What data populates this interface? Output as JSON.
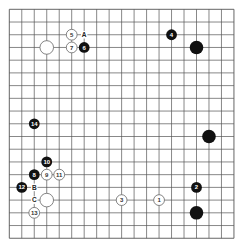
{
  "board": {
    "size": 19,
    "origin": {
      "x": 9.3,
      "y": 9.3
    },
    "spacing": {
      "x": 12.48,
      "y": 12.72
    },
    "colors": {
      "background": "#ffffff",
      "grid_line": "#555555",
      "black_stone": "#111111",
      "white_stone": "#ffffff",
      "white_stone_border": "#666666",
      "black_label": "#ffffff",
      "white_label": "#333333"
    }
  },
  "stones": [
    {
      "color": "white",
      "col": 3,
      "row": 3,
      "label": ""
    },
    {
      "color": "white",
      "col": 5,
      "row": 2,
      "label": "5"
    },
    {
      "color": "white",
      "col": 5,
      "row": 3,
      "label": "7"
    },
    {
      "color": "black",
      "col": 6,
      "row": 3,
      "label": "6"
    },
    {
      "color": "black",
      "col": 13,
      "row": 2,
      "label": "4"
    },
    {
      "color": "black",
      "col": 15,
      "row": 3,
      "label": ""
    },
    {
      "color": "black",
      "col": 2,
      "row": 9,
      "label": "14"
    },
    {
      "color": "black",
      "col": 16,
      "row": 10,
      "label": ""
    },
    {
      "color": "black",
      "col": 3,
      "row": 12,
      "label": "10"
    },
    {
      "color": "black",
      "col": 2,
      "row": 13,
      "label": "8"
    },
    {
      "color": "white",
      "col": 3,
      "row": 13,
      "label": "9"
    },
    {
      "color": "white",
      "col": 4,
      "row": 13,
      "label": "11"
    },
    {
      "color": "black",
      "col": 1,
      "row": 14,
      "label": "12"
    },
    {
      "color": "black",
      "col": 15,
      "row": 14,
      "label": "2"
    },
    {
      "color": "white",
      "col": 3,
      "row": 15,
      "label": ""
    },
    {
      "color": "white",
      "col": 9,
      "row": 15,
      "label": "3"
    },
    {
      "color": "white",
      "col": 12,
      "row": 15,
      "label": "1"
    },
    {
      "color": "white",
      "col": 2,
      "row": 16,
      "label": "13"
    },
    {
      "color": "black",
      "col": 15,
      "row": 16,
      "label": ""
    }
  ],
  "marks": [
    {
      "col": 6,
      "row": 2,
      "label": "A"
    },
    {
      "col": 2,
      "row": 14,
      "label": "B"
    },
    {
      "col": 2,
      "row": 15,
      "label": "C"
    }
  ]
}
